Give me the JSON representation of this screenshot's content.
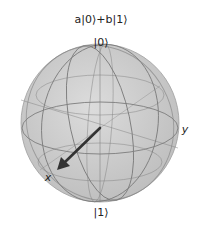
{
  "figure": {
    "title": "a|0⟩+b|1⟩",
    "labels": {
      "north": "|0⟩",
      "south": "|1⟩",
      "x_axis": "x",
      "y_axis": "y"
    },
    "sphere": {
      "type": "bloch-sphere",
      "fill_color": "#c8c8c8",
      "edge_color": "#8a8a8a",
      "vector_color": "#333333"
    },
    "state_vector": {
      "direction": "+x"
    }
  }
}
